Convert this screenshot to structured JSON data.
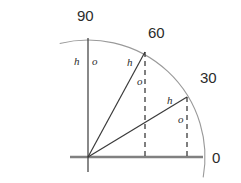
{
  "figure": {
    "type": "trigonometry-unit-circle-diagram",
    "background_color": "#ffffff",
    "line_color": "#3a3a3a",
    "axis_color": "#808080",
    "arc_color": "#9a9a9a",
    "dashed_color": "#2b2b2b",
    "text_color": "#2b2b2b"
  },
  "angle_labels": [
    {
      "text": "90",
      "x": 77,
      "y": 8
    },
    {
      "text": "60",
      "x": 148,
      "y": 25
    },
    {
      "text": "30",
      "x": 200,
      "y": 70
    },
    {
      "text": "0",
      "x": 212,
      "y": 150
    }
  ],
  "side_labels": [
    {
      "text": "h",
      "x": 74,
      "y": 56,
      "ray": "90-hypotenuse"
    },
    {
      "text": "o",
      "x": 92,
      "y": 56,
      "ray": "90-opposite"
    },
    {
      "text": "h",
      "x": 127,
      "y": 57,
      "ray": "60-hypotenuse"
    },
    {
      "text": "o",
      "x": 137,
      "y": 76,
      "ray": "60-opposite"
    },
    {
      "text": "h",
      "x": 167,
      "y": 95,
      "ray": "30-hypotenuse"
    },
    {
      "text": "o",
      "x": 178,
      "y": 114,
      "ray": "30-opposite"
    }
  ],
  "geometry": {
    "origin": {
      "x": 88,
      "y": 157
    },
    "radius": 117,
    "arc_start_angle_deg": 104,
    "arc_end_angle_deg": -10,
    "rays": [
      {
        "angle_deg": 90,
        "end_x": 88,
        "end_y": 38,
        "style": "solid"
      },
      {
        "angle_deg": 60,
        "end_x": 145,
        "end_y": 52,
        "style": "solid"
      },
      {
        "angle_deg": 30,
        "end_x": 187,
        "end_y": 97,
        "style": "solid"
      }
    ],
    "dropped_perpendiculars": [
      {
        "from_angle_deg": 60,
        "x": 145,
        "y_top": 52,
        "y_bottom": 157
      },
      {
        "from_angle_deg": 30,
        "x": 187,
        "y_top": 97,
        "y_bottom": 157
      }
    ],
    "horizontal_axis": {
      "x1": 70,
      "x2": 203,
      "y": 157
    },
    "vertical_axis": {
      "x": 88,
      "y1": 38,
      "y2": 172
    }
  }
}
